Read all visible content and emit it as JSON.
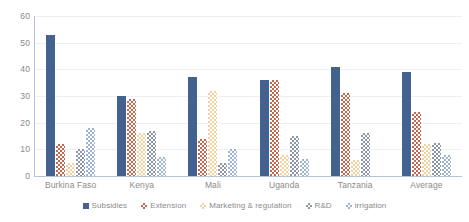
{
  "chart_data": {
    "type": "bar",
    "title": "",
    "subtitle": "",
    "xlabel": "",
    "ylabel": "",
    "ylim": [
      0,
      60
    ],
    "ytick_step": 10,
    "ytick_labels": [
      "60",
      "50",
      "40",
      "30",
      "20",
      "10",
      "0"
    ],
    "grid": true,
    "grid_axis": "y",
    "legend_position": "bottom",
    "orientation": "vertical",
    "grouping": "grouped",
    "categories": [
      "Burkina Faso",
      "Kenya",
      "Mali",
      "Uganda",
      "Tanzania",
      "Average"
    ],
    "series": [
      {
        "name": "Subsidies",
        "color": "#44628f",
        "pattern": "solid",
        "values": [
          53,
          30,
          37,
          36,
          41,
          39
        ]
      },
      {
        "name": "Extension",
        "color": "#c4674f",
        "pattern": "checker",
        "values": [
          12,
          29,
          14,
          36,
          31,
          24
        ]
      },
      {
        "name": "Marketing & regulation",
        "color": "#f0d2a0",
        "pattern": "checker",
        "values": [
          5,
          16,
          32,
          8,
          6,
          12
        ]
      },
      {
        "name": "R&D",
        "color": "#8c96aa",
        "pattern": "checker",
        "values": [
          10,
          17,
          5,
          15,
          16,
          12.5
        ]
      },
      {
        "name": "irrigation",
        "color": "#9db3cf",
        "pattern": "checker",
        "values": [
          18,
          7,
          10,
          6.5,
          0,
          8
        ]
      }
    ]
  }
}
